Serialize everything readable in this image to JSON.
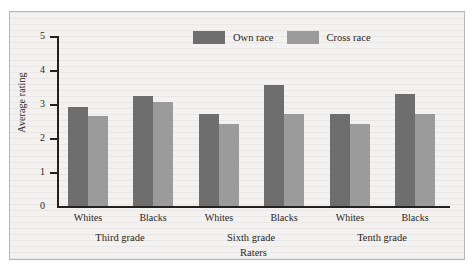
{
  "chart_data": {
    "type": "bar",
    "title": "",
    "xlabel": "Raters",
    "ylabel": "Average rating",
    "ylim": [
      0,
      5
    ],
    "yticks": [
      "0",
      "1",
      "2",
      "3",
      "4",
      "5"
    ],
    "grid": false,
    "legend_position": "top-center",
    "categories": [
      "Whites",
      "Blacks",
      "Whites",
      "Blacks",
      "Whites",
      "Blacks"
    ],
    "groups": [
      {
        "label": "Third grade",
        "categories": [
          "Whites",
          "Blacks"
        ]
      },
      {
        "label": "Sixth grade",
        "categories": [
          "Whites",
          "Blacks"
        ]
      },
      {
        "label": "Tenth grade",
        "categories": [
          "Whites",
          "Blacks"
        ]
      }
    ],
    "series": [
      {
        "name": "Own race",
        "color": "#6e6e6e",
        "values": [
          2.9,
          3.25,
          2.7,
          3.55,
          2.7,
          3.3
        ]
      },
      {
        "name": "Cross race",
        "color": "#9b9b9b",
        "values": [
          2.65,
          3.05,
          2.4,
          2.7,
          2.4,
          2.7
        ]
      }
    ]
  },
  "legend": {
    "items": [
      {
        "label": "Own race",
        "color": "#6e6e6e"
      },
      {
        "label": "Cross race",
        "color": "#9b9b9b"
      }
    ]
  },
  "axes": {
    "y_title": "Average rating",
    "x_title": "Raters",
    "y_ticks": [
      "5",
      "4",
      "3",
      "2",
      "1",
      "0"
    ]
  }
}
